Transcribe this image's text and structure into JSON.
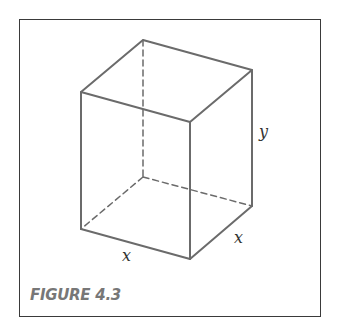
{
  "figure": {
    "caption": "FIGURE 4.3",
    "labels": {
      "height": "y",
      "depth": "x",
      "width": "x"
    },
    "edge_color": "#6b6b6b",
    "frame_color": "#3a3a3a"
  }
}
